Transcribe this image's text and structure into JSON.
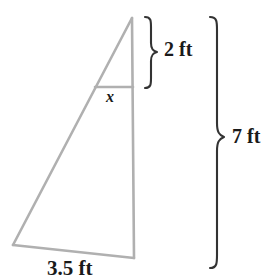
{
  "figure": {
    "type": "geometry-diagram",
    "colors": {
      "shape_stroke": "#b0b0b0",
      "brace_stroke": "#333333",
      "text": "#1a1a1a",
      "background": "#ffffff"
    },
    "labels": {
      "top_brace": "2 ft",
      "right_brace": "7 ft",
      "base": "3.5 ft",
      "unknown_segment": "x"
    },
    "geometry": {
      "apex": [
        132,
        18
      ],
      "bottom_left": [
        13,
        245
      ],
      "bottom_right": [
        134,
        258
      ],
      "inner_left": [
        95,
        87
      ],
      "inner_right": [
        133,
        87
      ]
    },
    "measurements": [
      {
        "name": "top-height",
        "value": 2,
        "unit": "ft"
      },
      {
        "name": "total-height",
        "value": 7,
        "unit": "ft"
      },
      {
        "name": "base-width",
        "value": 3.5,
        "unit": "ft"
      },
      {
        "name": "unknown-width",
        "value": "x",
        "unit": "ft"
      }
    ]
  }
}
